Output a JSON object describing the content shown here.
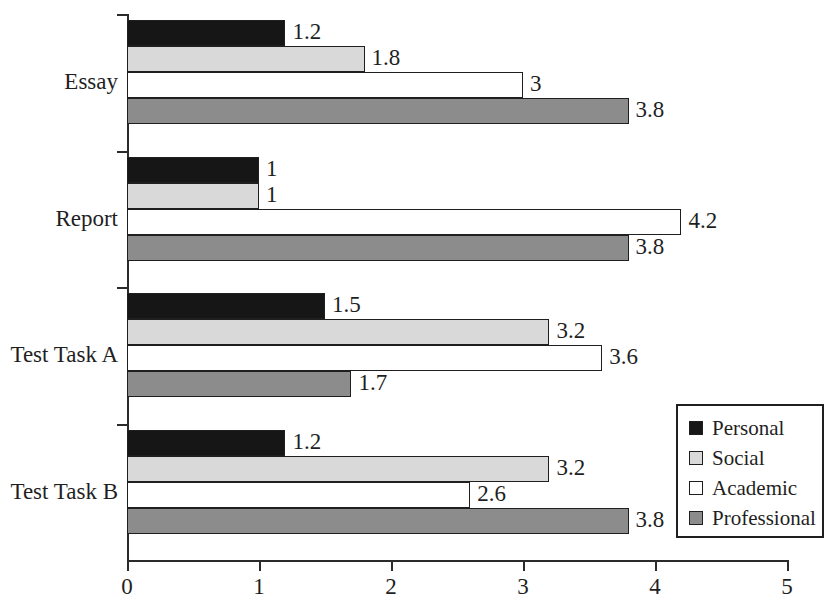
{
  "chart_data": {
    "type": "bar",
    "orientation": "horizontal",
    "title": "",
    "xlabel": "",
    "ylabel": "",
    "xlim": [
      0,
      5
    ],
    "xticks": [
      "0",
      "1",
      "2",
      "3",
      "4",
      "5"
    ],
    "grid": false,
    "legend_position": "bottom-right",
    "categories": [
      "Essay",
      "Report",
      "Test Task A",
      "Test Task B"
    ],
    "series": [
      {
        "name": "Personal",
        "color": "#161616",
        "values": [
          1.2,
          1,
          1.5,
          1.2
        ]
      },
      {
        "name": "Social",
        "color": "#d9d9d9",
        "values": [
          1.8,
          1,
          3.2,
          3.2
        ]
      },
      {
        "name": "Academic",
        "color": "#ffffff",
        "values": [
          3,
          4.2,
          3.6,
          2.6
        ]
      },
      {
        "name": "Professional",
        "color": "#8c8c8c",
        "values": [
          3.8,
          3.8,
          1.7,
          3.8
        ]
      }
    ],
    "value_labels": [
      [
        "1.2",
        "1.8",
        "3",
        "3.8"
      ],
      [
        "1",
        "1",
        "4.2",
        "3.8"
      ],
      [
        "1.5",
        "3.2",
        "3.6",
        "1.7"
      ],
      [
        "1.2",
        "3.2",
        "2.6",
        "3.8"
      ]
    ]
  },
  "legend": {
    "items": [
      {
        "label": "Personal"
      },
      {
        "label": "Social"
      },
      {
        "label": "Academic"
      },
      {
        "label": "Professional"
      }
    ]
  }
}
